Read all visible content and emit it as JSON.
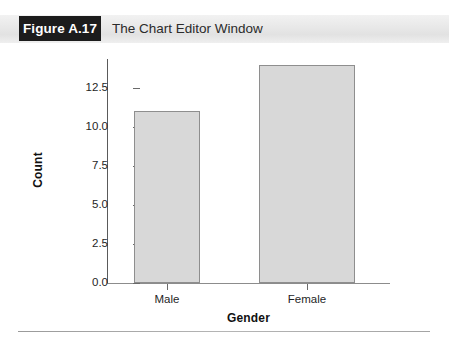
{
  "figure": {
    "tag": "Figure A.17",
    "caption": "The Chart Editor Window"
  },
  "colors": {
    "tag_background": "#1c1c1c",
    "tag_text": "#ffffff",
    "header_band": "#eaeaea",
    "bar_fill": "#d8d8d8",
    "bar_border": "#8e8e8e",
    "axis_line": "#6a6a6a",
    "text": "#1f1f1f"
  },
  "chart_data": {
    "type": "bar",
    "title": "",
    "subtitle": "",
    "categories": [
      "Male",
      "Female"
    ],
    "values": [
      11,
      14
    ],
    "xlabel": "Gender",
    "ylabel": "Count",
    "ylim": [
      0.0,
      14.5
    ],
    "ytick_labels": [
      "12.5",
      "10.0",
      "7.5",
      "5.0",
      "2.5",
      "0.0"
    ],
    "ytick_values": [
      12.5,
      10.0,
      7.5,
      5.0,
      2.5,
      0.0
    ],
    "grid": false,
    "legend": false,
    "legend_position": "none",
    "annotations": []
  }
}
